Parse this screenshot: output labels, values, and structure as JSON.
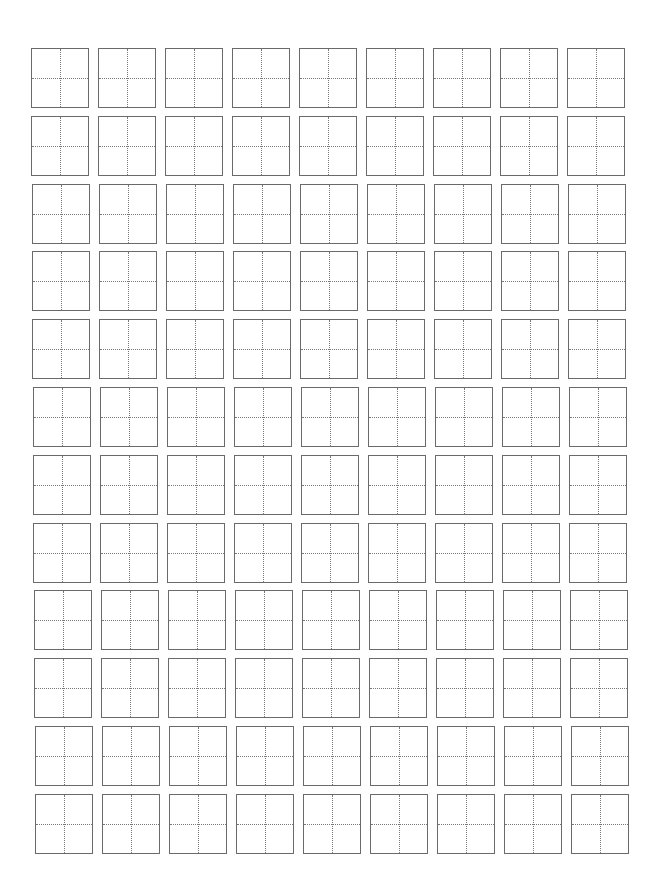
{
  "document": {
    "type": "tianzige-practice-sheet",
    "rows": 12,
    "columns": 9,
    "grid": {
      "origin_x": 31,
      "origin_y": 48,
      "col_step": 67,
      "row_step": 67.8,
      "row_skew_x": 0.35,
      "box_width": 58,
      "box_height": 60
    },
    "colors": {
      "border": "#6a6a6a",
      "guide": "#7a7a7a",
      "background": "#ffffff"
    }
  }
}
